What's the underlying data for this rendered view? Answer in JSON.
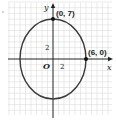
{
  "diagram": {
    "type": "ellipse-graph",
    "axes": {
      "x_label": "x",
      "y_label": "y",
      "origin_label": "O"
    },
    "tick_labels": {
      "x": "2",
      "y": "2"
    },
    "points": [
      {
        "label": "(0, 7)",
        "x": 0,
        "y": 7
      },
      {
        "label": "(6, 0)",
        "x": 6,
        "y": 0
      }
    ],
    "ellipse": {
      "center": [
        0,
        0
      ],
      "semi_x": 6,
      "semi_y": 7
    },
    "colors": {
      "grid": "#d8d8d8",
      "axis": "#222222",
      "curve": "#3a3a3a"
    }
  }
}
